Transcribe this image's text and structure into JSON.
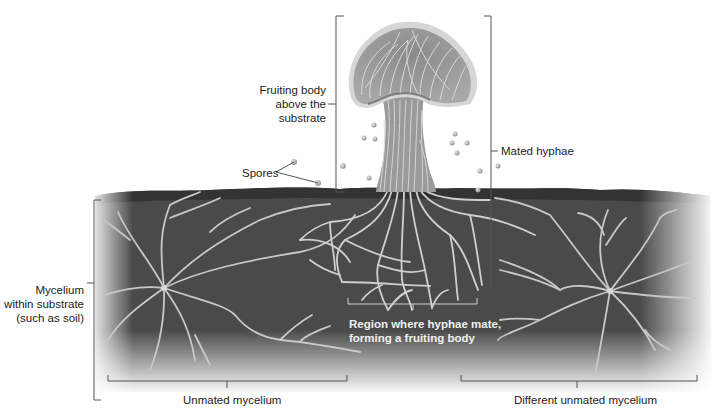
{
  "diagram": {
    "labels": {
      "fruiting_body": [
        "Fruiting body",
        "above the",
        "substrate"
      ],
      "spores": "Spores",
      "mated_hyphae": "Mated hyphae",
      "mycelium": [
        "Mycelium",
        "within substrate",
        "(such as soil)"
      ],
      "mating_region": [
        "Region where hyphae mate,",
        "forming a fruiting body"
      ],
      "unmated_mycelium": "Unmated mycelium",
      "different_unmated_mycelium": "Different unmated mycelium"
    },
    "colors": {
      "background": "#ffffff",
      "soil": "#4a4a4a",
      "soil_dark": "#3a3a3a",
      "hyphae": "#c8c8c8",
      "mushroom_fill": "#9a9a9a",
      "mushroom_rim": "#d6d6d6",
      "bracket": "#555555",
      "text": "#222222",
      "text_on_soil": "#f0f0f0"
    }
  }
}
